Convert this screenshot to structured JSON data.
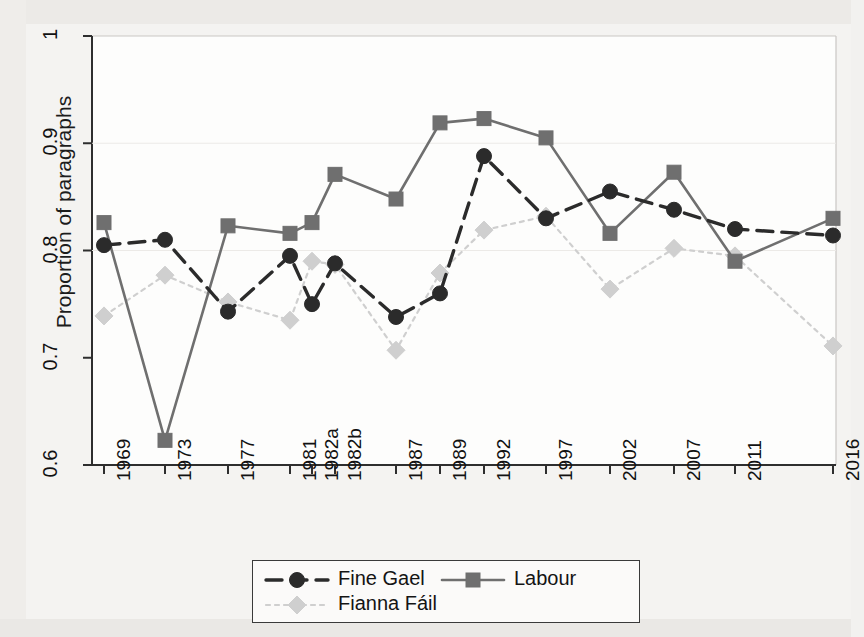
{
  "figure": {
    "ylabel": "Proportion of paragraphs",
    "background_color": "#f4f3f1"
  },
  "legend": {
    "entries": [
      {
        "label": "Fine Gael",
        "color": "#2b2b2b",
        "marker": "circle",
        "dash": "dashed"
      },
      {
        "label": "Labour",
        "color": "#6f6f6f",
        "marker": "square",
        "dash": "solid"
      },
      {
        "label": "Fianna Fáil",
        "color": "#cfcfcf",
        "marker": "diamond",
        "dash": "dotted"
      }
    ]
  },
  "chart_data": {
    "type": "line",
    "title": "",
    "xlabel": "",
    "ylabel": "Proportion of paragraphs",
    "ylim": [
      0.6,
      1.0
    ],
    "yticks": [
      0.6,
      0.7,
      0.8,
      0.9,
      1.0
    ],
    "ytick_labels": [
      "0.6",
      "0.7",
      "0.8",
      "0.9",
      "1"
    ],
    "grid": false,
    "legend_position": "below",
    "categories": [
      "1969",
      "1973",
      "1977",
      "1981",
      "1982a",
      "1982b",
      "1987",
      "1989",
      "1992",
      "1997",
      "2002",
      "2007",
      "2011",
      "2016"
    ],
    "series": [
      {
        "name": "Fine Gael",
        "color": "#2b2b2b",
        "marker": "circle",
        "dash": "dashed",
        "values": [
          0.805,
          0.81,
          0.743,
          0.795,
          0.75,
          0.788,
          0.738,
          0.76,
          0.888,
          0.83,
          0.855,
          0.838,
          0.82,
          0.814
        ]
      },
      {
        "name": "Labour",
        "color": "#6f6f6f",
        "marker": "square",
        "dash": "solid",
        "values": [
          0.826,
          0.623,
          0.823,
          0.816,
          0.826,
          0.871,
          0.848,
          0.919,
          0.923,
          0.905,
          0.816,
          0.873,
          0.79,
          0.83
        ]
      },
      {
        "name": "Fianna Fáil",
        "color": "#cfcfcf",
        "marker": "diamond",
        "dash": "dotted",
        "values": [
          0.739,
          0.777,
          0.752,
          0.735,
          0.79,
          0.787,
          0.707,
          0.779,
          0.819,
          0.832,
          0.764,
          0.802,
          0.795,
          0.711
        ]
      }
    ]
  }
}
